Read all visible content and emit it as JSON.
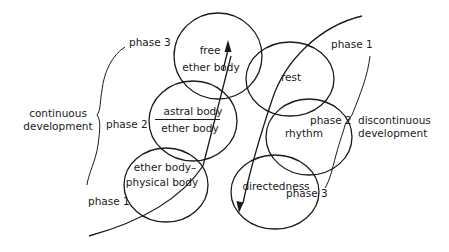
{
  "diagram": {
    "type": "overlapping-circles-with-phase-arcs",
    "colors": {
      "ink": "#1a1a1a",
      "background": "#ffffff"
    },
    "left_group": {
      "label_line1": "continuous",
      "label_line2": "development",
      "phases": [
        "phase 3",
        "phase 2",
        "phase 1"
      ]
    },
    "right_group": {
      "label_line1": "discontinuous",
      "label_line2": "development",
      "phases": [
        "phase 1",
        "phase 2",
        "phase 3"
      ]
    },
    "left_circles": [
      {
        "id": "free-ether-body",
        "line1": "free",
        "line2": "ether body"
      },
      {
        "id": "astral-ether-body",
        "numerator": "astral body",
        "denominator": "ether body"
      },
      {
        "id": "ether-physical-body",
        "line1": "ether body–",
        "line2": "physical body"
      }
    ],
    "right_circles": [
      {
        "id": "rest",
        "label": "rest"
      },
      {
        "id": "rhythm",
        "label": "rhythm"
      },
      {
        "id": "directedness",
        "label": "directedness"
      }
    ],
    "arrows": [
      {
        "name": "upward-arrow",
        "direction": "up",
        "from": "ether-physical-body",
        "to": "free-ether-body"
      },
      {
        "name": "downward-arrow",
        "direction": "down",
        "from": "rest",
        "to": "directedness"
      }
    ]
  }
}
